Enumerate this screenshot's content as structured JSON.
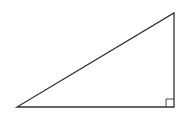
{
  "diagram": {
    "type": "right-triangle",
    "stroke_color": "#333333",
    "background": "#ffffff",
    "vertices": {
      "bottom_left": [
        17,
        107
      ],
      "bottom_right": [
        174,
        107
      ],
      "top_right": [
        174,
        13
      ]
    },
    "right_angle_marker": {
      "corner": "bottom_right",
      "size": 8
    },
    "labels": []
  }
}
